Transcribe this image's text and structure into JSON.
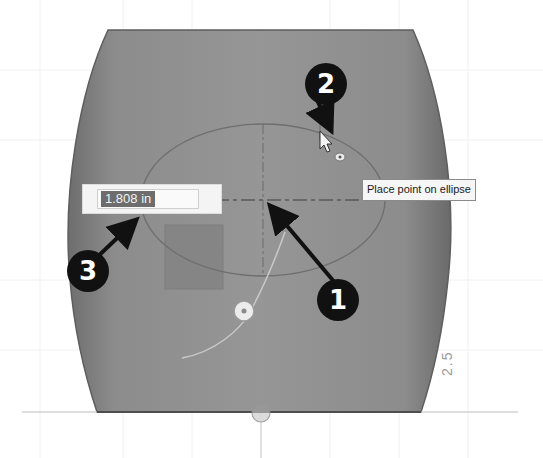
{
  "viewport": {
    "background": "#ffffff",
    "body_color": "#8f8f8f",
    "body_edge_color": "#6a6a6a"
  },
  "sketch": {
    "ellipse": {
      "cx": 263,
      "cy": 200,
      "rx": 122,
      "ry": 76,
      "color": "#6f6f6f"
    },
    "center_point": {
      "x": 263,
      "y": 200
    },
    "cursor_point": {
      "x": 320,
      "y": 133
    },
    "snap_point": {
      "x": 340,
      "y": 157
    },
    "construction_point": {
      "x": 244,
      "y": 311
    },
    "origin_point": {
      "x": 261,
      "y": 413
    }
  },
  "dimension_input": {
    "value": "1.808 in",
    "icon": "dimension-input"
  },
  "tooltip": {
    "text": "Place point on ellipse"
  },
  "ruler": {
    "label": "2.5"
  },
  "callouts": [
    {
      "number": "1",
      "x": 317,
      "y": 279
    },
    {
      "number": "2",
      "x": 305,
      "y": 63
    },
    {
      "number": "3",
      "x": 67,
      "y": 250
    }
  ]
}
